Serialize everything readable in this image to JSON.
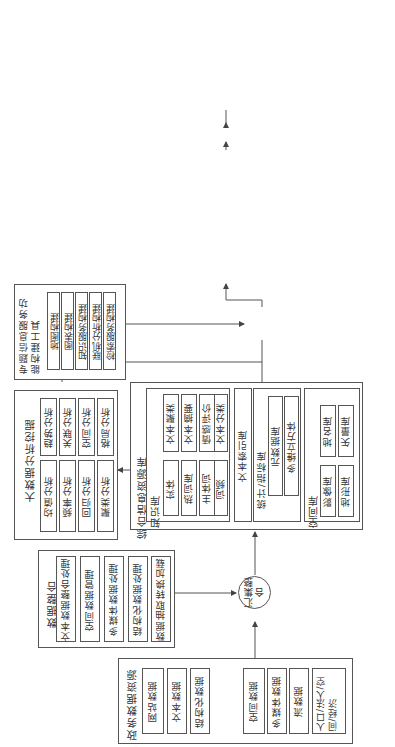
{
  "diagram": {
    "sources": {
      "title": "政务数据资源",
      "items": [
        "网站数据",
        "文本数据",
        "结构化数据",
        "空间数据",
        "多媒体数据",
        "流数据",
        "人口/法人/空间/经济"
      ]
    },
    "integration": {
      "title": "数据整合",
      "items": [
        "文本数据整合处理",
        "空间数据管理",
        "多媒体数据处理",
        "结构化数据处理",
        "数据抽取转换加载"
      ]
    },
    "node_collect": "汇集整合",
    "resource_db": {
      "title": "综合信息资源库",
      "knowledge": {
        "title": "知识库",
        "left": [
          "实体",
          "热词库",
          "主体词",
          "词频"
        ],
        "right": [
          "文本聚类",
          "文本摘要",
          "情感评价",
          "文本分类"
        ]
      },
      "text_index": "文本索引库",
      "stats": {
        "title": "统计/指标库",
        "items": [
          "元数据库",
          "多维立方体"
        ]
      },
      "spatial": {
        "title": "空间库",
        "items": [
          "影像库",
          "地形库",
          "地名库",
          "矢量库"
        ]
      },
      "indicator_class": "指示分类库"
    },
    "bigdata_mining": {
      "title": "大数据分析挖掘",
      "items": [
        "均值分析",
        "频率分析",
        "回归分析",
        "聚类分析",
        "趋势分析",
        "关联分析",
        "空间分析",
        "格局分析"
      ]
    },
    "function_tools": {
      "title": "专题信息服务功能构建工具",
      "items": [
        "地图构建",
        "图表构建",
        "知识服务构建",
        "联机分析构建",
        "检索服务构建",
        "数据挖掘构建",
        "报表构建",
        "信息发布"
      ]
    },
    "node_build": "专题构建",
    "vis_tools": {
      "title": "可视化服务工具",
      "items": [
        "统计图表",
        "统计报表",
        "分级地图",
        "基础地图",
        "统计地图",
        "知识地图",
        "主题检索",
        "多维分析可视化",
        "大数据可视化"
      ]
    },
    "node_publish": "专题发布",
    "service_system": {
      "title": "专题信息服务分析系统",
      "items": [
        "地图可视化服务",
        "指标运行服务",
        "统计报表服务",
        "知识地图服务",
        "大数据分析服务",
        "信息检索服务",
        "数据共享服务"
      ]
    }
  }
}
